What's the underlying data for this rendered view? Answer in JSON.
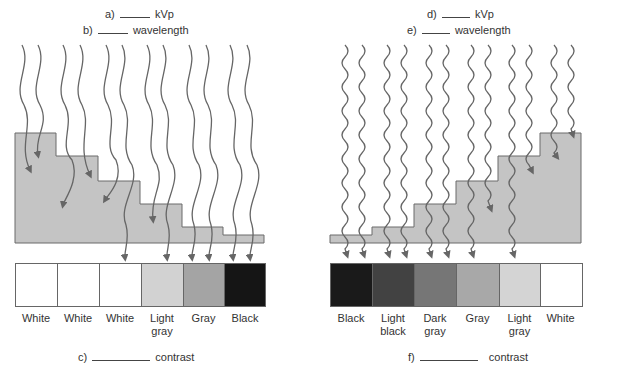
{
  "left_panel": {
    "question_a": {
      "prefix": "a)",
      "suffix": "kVp"
    },
    "question_b": {
      "prefix": "b)",
      "suffix": "wavelength"
    },
    "question_c": {
      "prefix": "c)",
      "suffix": "contrast"
    },
    "wave_type": "long-wavelength",
    "swatches": [
      {
        "label": "White",
        "color": "#ffffff"
      },
      {
        "label": "White",
        "color": "#ffffff"
      },
      {
        "label": "White",
        "color": "#ffffff"
      },
      {
        "label": "Light gray",
        "color": "#d2d2d2"
      },
      {
        "label": "Gray",
        "color": "#a4a4a4"
      },
      {
        "label": "Black",
        "color": "#151515"
      }
    ]
  },
  "right_panel": {
    "question_d": {
      "prefix": "d)",
      "suffix": "kVp"
    },
    "question_e": {
      "prefix": "e)",
      "suffix": "wavelength"
    },
    "question_f": {
      "prefix": "f)",
      "suffix": "contrast"
    },
    "wave_type": "short-wavelength",
    "swatches": [
      {
        "label": "Black",
        "color": "#1a1a1a"
      },
      {
        "label": "Light black",
        "color": "#424242"
      },
      {
        "label": "Dark gray",
        "color": "#767676"
      },
      {
        "label": "Gray",
        "color": "#a8a8a8"
      },
      {
        "label": "Light gray",
        "color": "#d4d4d4"
      },
      {
        "label": "White",
        "color": "#ffffff"
      }
    ]
  },
  "colors": {
    "wedge_fill": "#c4c4c4",
    "wedge_stroke": "#6a6a6a",
    "ray_stroke": "#666666"
  }
}
